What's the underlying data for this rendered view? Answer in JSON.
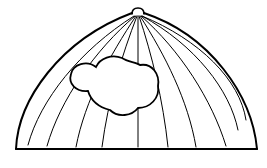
{
  "figure": {
    "description": "Line drawing of a dome with meridian lines and a cloud shape",
    "stroke_color": "#000000",
    "background_color": "#ffffff",
    "elements": [
      "dome-outline",
      "top-knob",
      "meridian-lines",
      "cloud",
      "base-line"
    ]
  }
}
